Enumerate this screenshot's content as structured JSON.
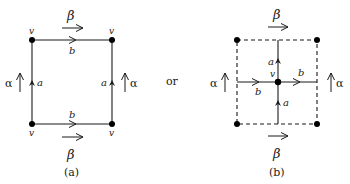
{
  "figure": {
    "connector_text": "or",
    "panels": [
      {
        "id": "a",
        "caption": "(a)",
        "vertex_labels": [
          "v",
          "v",
          "v",
          "v"
        ],
        "edge_labels": {
          "top": "b",
          "bottom": "b",
          "left": "a",
          "right": "a"
        },
        "field_labels": {
          "top": "β",
          "bottom": "β",
          "left": "α",
          "right": "α"
        },
        "border_style": "solid"
      },
      {
        "id": "b",
        "caption": "(b)",
        "center_vertex_label": "v",
        "edge_labels": {
          "up": "a",
          "down": "a",
          "left": "b",
          "right": "b"
        },
        "field_labels": {
          "top": "β",
          "bottom": "β",
          "left": "α",
          "right": "α"
        },
        "border_style": "dashed"
      }
    ]
  },
  "colors": {
    "ink": "#1a1a1a",
    "background": "#ffffff"
  }
}
